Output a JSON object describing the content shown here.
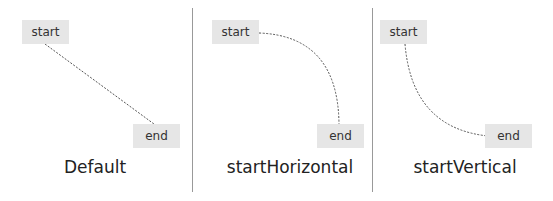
{
  "panels": [
    {
      "id": "default",
      "caption": "Default",
      "start_label": "start",
      "end_label": "end",
      "style": "straight"
    },
    {
      "id": "startHorizontal",
      "caption": "startHorizontal",
      "start_label": "start",
      "end_label": "end",
      "style": "curve-horizontal-first"
    },
    {
      "id": "startVertical",
      "caption": "startVertical",
      "start_label": "start",
      "end_label": "end",
      "style": "curve-vertical-first"
    }
  ],
  "colors": {
    "box_fill": "#e6e6e6",
    "line": "#555555",
    "divider": "#999999"
  }
}
